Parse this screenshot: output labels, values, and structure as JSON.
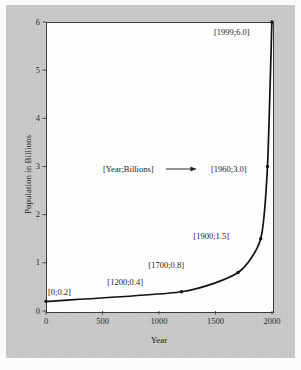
{
  "figure": {
    "background_color": "#c9c9c9",
    "plot_background_color": "#fdfdfd",
    "frame_color": "#3a3a3a",
    "curve_color": "#111111",
    "watermark_text": "POPULATION"
  },
  "annotation": {
    "legend_key": "[Year;Billions]",
    "arrow_icon": "right-arrow-icon"
  },
  "chart_data": {
    "type": "line",
    "title": "",
    "xlabel": "Year",
    "ylabel": "Population in Billions",
    "xlim": [
      0,
      2000
    ],
    "ylim": [
      0,
      6
    ],
    "grid": false,
    "legend": "none",
    "xticks": [
      "0",
      "500",
      "1000",
      "1500",
      "2000"
    ],
    "xtick_values": [
      0,
      500,
      1000,
      1500,
      2000
    ],
    "yticks": [
      "0",
      "1",
      "2",
      "3",
      "4",
      "5",
      "6"
    ],
    "ytick_values": [
      0,
      1,
      2,
      3,
      4,
      5,
      6
    ],
    "x": [
      0,
      1200,
      1700,
      1900,
      1960,
      1999
    ],
    "y": [
      0.2,
      0.4,
      0.8,
      1.5,
      3.0,
      6.0
    ],
    "point_labels": [
      "[0;0.2]",
      "[1200;0.4]",
      "[1700;0.8]",
      "[1900;1.5]",
      "[1960;3.0]",
      "[1999;6.0]"
    ],
    "series": [
      {
        "name": "World population",
        "values": [
          0.2,
          0.4,
          0.8,
          1.5,
          3.0,
          6.0
        ]
      }
    ]
  }
}
